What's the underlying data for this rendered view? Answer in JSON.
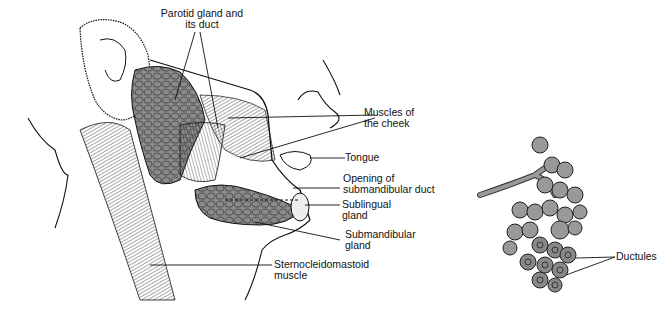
{
  "figure": {
    "colors": {
      "gland": "#8a8a8a",
      "gland_dark": "#555555",
      "acini": "#999999",
      "ink": "#111111",
      "background": "#ffffff"
    },
    "head_view": {
      "labels": [
        {
          "id": "parotid",
          "text_line1": "Parotid gland and",
          "text_line2": "its duct"
        },
        {
          "id": "cheek_muscles",
          "text_line1": "Muscles of",
          "text_line2": "the cheek"
        },
        {
          "id": "tongue",
          "text_line1": "Tongue"
        },
        {
          "id": "submandibular_duct_opening",
          "text_line1": "Opening of",
          "text_line2": "submandibular duct"
        },
        {
          "id": "sublingual",
          "text_line1": "Sublingual",
          "text_line2": "gland"
        },
        {
          "id": "submandibular",
          "text_line1": "Submandibular",
          "text_line2": "gland"
        },
        {
          "id": "scm",
          "text_line1": "Sternocleidomastoid",
          "text_line2": "muscle"
        }
      ]
    },
    "acini_view": {
      "labels": [
        {
          "id": "ductules",
          "text_line1": "Ductules"
        }
      ]
    }
  }
}
